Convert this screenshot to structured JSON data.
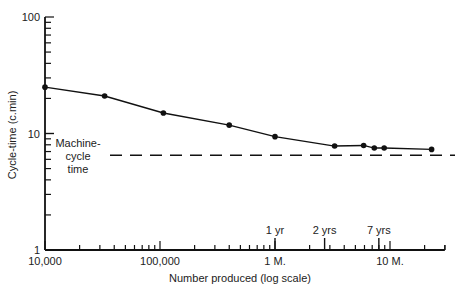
{
  "chart_data": {
    "type": "line",
    "title": "",
    "xlabel": "Number produced (log scale)",
    "ylabel": "Cycle-time (c.min)",
    "xscale": "log",
    "yscale": "log",
    "xlim": [
      10000,
      30000000
    ],
    "ylim": [
      1,
      100
    ],
    "x_tick_labels": [
      "10,000",
      "100,000",
      "1 M.",
      "10 M."
    ],
    "y_tick_labels": [
      "1",
      "10",
      "100"
    ],
    "grid": false,
    "series": [
      {
        "name": "Cycle time",
        "x": [
          10000,
          33000,
          107000,
          400000,
          1000000,
          3300000,
          5900000,
          7300000,
          8900000,
          23000000
        ],
        "y": [
          25,
          21,
          15,
          11.8,
          9.4,
          7.8,
          7.9,
          7.5,
          7.5,
          7.3
        ]
      }
    ],
    "reference_lines": [
      {
        "label": "Machine-cycle time",
        "y": 6.5,
        "style": "dashed"
      }
    ],
    "annotations": [
      {
        "text": "1 yr",
        "x": 1000000
      },
      {
        "text": "2 yrs",
        "x": 2700000
      },
      {
        "text": "7 yrs",
        "x": 8000000
      }
    ]
  },
  "labels": {
    "ref_line_1": "Machine-",
    "ref_line_2": "cycle",
    "ref_line_3": "time"
  }
}
